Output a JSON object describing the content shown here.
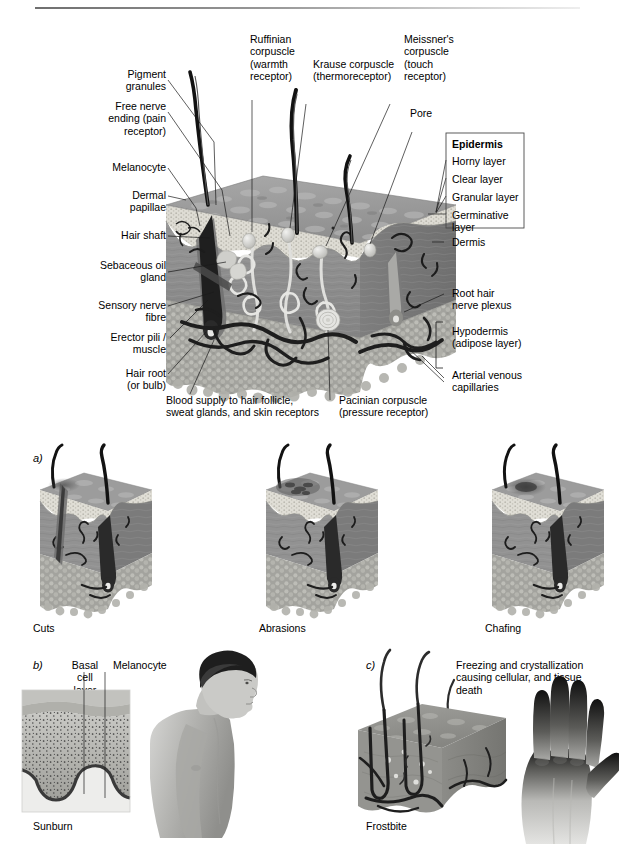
{
  "figure": {
    "title_rule": true,
    "domain": "anatomical-illustration"
  },
  "colors": {
    "epidermis_surface": "#9a9a9a",
    "epidermis_granular": "#d9d9d2",
    "dermis": "#8c8c8c",
    "hypodermis": "#a5a5a0",
    "hair": "#1c1c1c",
    "vessel": "#2b2b2b",
    "leader_line": "#1a1a1a",
    "text": "#000000",
    "background": "#ffffff"
  },
  "main_diagram": {
    "labels_left": [
      {
        "id": "pigment-granules",
        "text": "Pigment\ngranules"
      },
      {
        "id": "free-nerve-ending",
        "text": "Free nerve\nending (pain\nreceptor)"
      },
      {
        "id": "melanocyte",
        "text": "Melanocyte"
      },
      {
        "id": "dermal-papillae",
        "text": "Dermal\npapillae"
      },
      {
        "id": "hair-shaft",
        "text": "Hair shaft"
      },
      {
        "id": "sebaceous-oil-gland",
        "text": "Sebaceous oil\ngland"
      },
      {
        "id": "sensory-nerve-fibre",
        "text": "Sensory nerve\nfibre"
      },
      {
        "id": "erector-pili-muscle",
        "text": "Erector pili /\nmuscle"
      },
      {
        "id": "hair-root",
        "text": "Hair root\n(or bulb)"
      }
    ],
    "labels_top": [
      {
        "id": "ruffinian-corpuscle",
        "text": "Ruffinian\ncorpuscle\n(warmth\nreceptor)"
      },
      {
        "id": "krause-corpuscle",
        "text": "Krause corpuscle\n(thermoreceptor)"
      },
      {
        "id": "meissners-corpuscle",
        "text": "Meissner's\ncorpuscle\n(touch\nreceptor)"
      },
      {
        "id": "pore",
        "text": "Pore"
      }
    ],
    "labels_right": [
      {
        "id": "dermis",
        "text": "Dermis"
      },
      {
        "id": "root-hair-nerve-plexus",
        "text": "Root hair\nnerve plexus"
      },
      {
        "id": "hypodermis",
        "text": "Hypodermis\n(adipose layer)"
      },
      {
        "id": "arterial-venous-capillaries",
        "text": "Arterial venous\ncapillaries"
      }
    ],
    "labels_bottom": [
      {
        "id": "blood-supply",
        "text": "Blood supply to hair follicle,\nsweat glands, and skin receptors"
      },
      {
        "id": "pacinian-corpuscle",
        "text": "Pacinian corpuscle\n(pressure receptor)"
      }
    ],
    "epidermis_box": {
      "id": "epidermis-box",
      "heading": "Epidermis",
      "layers": [
        "Horny layer",
        "Clear layer",
        "Granular layer",
        "Germinative\nlayer"
      ]
    }
  },
  "panel_a": {
    "marker": "a)",
    "items": [
      {
        "id": "cuts",
        "caption": "Cuts"
      },
      {
        "id": "abrasions",
        "caption": "Abrasions"
      },
      {
        "id": "chafing",
        "caption": "Chafing"
      }
    ]
  },
  "panel_b": {
    "marker": "b)",
    "caption": "Sunburn",
    "labels": [
      {
        "id": "basal-cell-layer",
        "text": "Basal\ncell\nlayer"
      },
      {
        "id": "melanocyte-b",
        "text": "Melanocyte"
      }
    ]
  },
  "panel_c": {
    "marker": "c)",
    "caption": "Frostbite",
    "note": "Freezing and crystallization\ncausing cellular, and tissue\ndeath"
  }
}
